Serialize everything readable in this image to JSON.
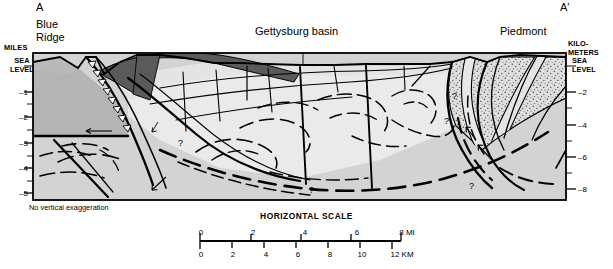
{
  "figure": {
    "type": "geologic-cross-section",
    "endpoint_left": "A",
    "endpoint_right": "A′",
    "note": "No vertical exaggeration"
  },
  "provinces": {
    "left": "Blue\nRidge",
    "left_line1": "Blue",
    "left_line2": "Ridge",
    "center": "Gettysburg basin",
    "right": "Piedmont",
    "state_line": "Pennsylvania | Maryland"
  },
  "axes": {
    "left": {
      "unit_label_line1": "MILES",
      "sea_level_line1": "SEA",
      "sea_level_line2": "LEVEL",
      "ticks": [
        "–1",
        "–2",
        "–3",
        "–4",
        "–5"
      ]
    },
    "right": {
      "unit_label_line1": "KILO-",
      "unit_label_line2": "METERS",
      "sea_level_line1": "SEA",
      "sea_level_line2": "LEVEL",
      "ticks": [
        "–2",
        "–4",
        "–6",
        "–8"
      ]
    }
  },
  "units": [
    {
      "id": "allochthonous",
      "label_l1": "Alloch-",
      "label_l2": "thonous",
      "label_l3": "rocks of",
      "label_l4": "South Mountain",
      "fill": "#b0b0b0"
    },
    {
      "id": "gettysburg-formation",
      "label": "Gettysburg Formation",
      "fill": "#59595a"
    },
    {
      "id": "new-oxford-formation",
      "label": "New Oxford Formation",
      "fill": "#e6e6e6"
    },
    {
      "id": "basement",
      "label_l1": "Nonmetamorphic Cambrian and",
      "label_l2": "Ordovician basement rocks",
      "fill": "#d0d0d0"
    },
    {
      "id": "metamorphic",
      "label_l1": "Metamorphic",
      "label_l2": "rocks",
      "fill": "#dcdcdc"
    }
  ],
  "annotations": {
    "query_marks": [
      "?",
      "?",
      "?",
      "?",
      "?"
    ]
  },
  "scale": {
    "title": "HORIZONTAL SCALE",
    "miles_ticks": [
      "0",
      "2",
      "4",
      "6",
      "8 MI"
    ],
    "km_ticks": [
      "0",
      "2",
      "4",
      "6",
      "8",
      "10",
      "12 KM"
    ]
  },
  "colors": {
    "light_gray": "#d7d7d7",
    "mid_gray": "#b6b6b6",
    "dark_gray": "#59595a",
    "pale": "#ebebeb",
    "stipple": "#dadada",
    "line": "#000000"
  }
}
